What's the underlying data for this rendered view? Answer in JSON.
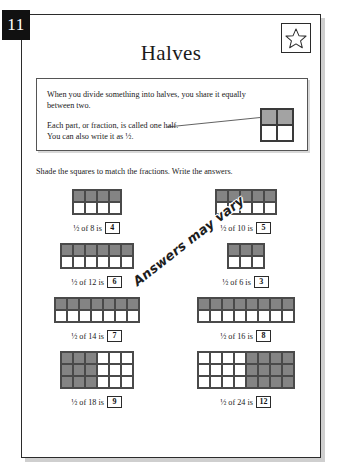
{
  "page": {
    "number": "11",
    "star_icon": "star-icon"
  },
  "title": "Halves",
  "info_box": {
    "line1": "When you divide something into halves, you share it equally",
    "line2": "between two.",
    "line3": "Each part, or fraction, is called one half.",
    "line4": "You can also write it as ½.",
    "demo": {
      "columns": 2,
      "rows": 2,
      "shaded_cells": [
        0,
        1
      ]
    }
  },
  "instruction": "Shade the squares to match the fractions. Write the answers.",
  "watermark": "Answers may vary",
  "exercises": [
    {
      "label_prefix": "½ of 8 is",
      "answer": "4",
      "columns": 4,
      "rows": 2,
      "shade_mode": "top-row",
      "shaded_count": 4
    },
    {
      "label_prefix": "½ of 10 is",
      "answer": "5",
      "columns": 5,
      "rows": 2,
      "shade_mode": "top-row",
      "shaded_count": 5
    },
    {
      "label_prefix": "½ of 12 is",
      "answer": "6",
      "columns": 6,
      "rows": 2,
      "shade_mode": "top-row",
      "shaded_count": 6
    },
    {
      "label_prefix": "½ of 6 is",
      "answer": "3",
      "columns": 3,
      "rows": 2,
      "shade_mode": "top-row",
      "shaded_count": 3
    },
    {
      "label_prefix": "½ of 14 is",
      "answer": "7",
      "columns": 7,
      "rows": 2,
      "shade_mode": "top-row",
      "shaded_count": 7
    },
    {
      "label_prefix": "½ of 16 is",
      "answer": "8",
      "columns": 8,
      "rows": 2,
      "shade_mode": "top-row",
      "shaded_count": 8
    },
    {
      "label_prefix": "½ of 18 is",
      "answer": "9",
      "columns": 6,
      "rows": 3,
      "shade_mode": "left-half",
      "shaded_count": 9
    },
    {
      "label_prefix": "½ of 24 is",
      "answer": "12",
      "columns": 8,
      "rows": 3,
      "shade_mode": "right-half",
      "shaded_count": 12
    }
  ],
  "colors": {
    "ink": "#1a1a1a",
    "shade_light": "#a3a3a3",
    "shade_dark": "#848484",
    "badge_bg": "#111111",
    "sheet_border": "#2b2b2b"
  }
}
